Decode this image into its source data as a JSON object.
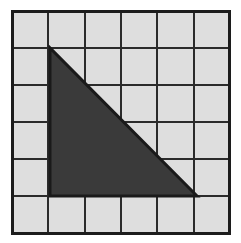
{
  "figure": {
    "title": "Shaded right triangle on a 6 by 6 square grid",
    "canvas": {
      "width": 241,
      "height": 243,
      "background_color": "#ffffff"
    }
  },
  "grid": {
    "columns": 6,
    "rows": 6,
    "origin_x": 12,
    "origin_y": 11,
    "cell_width": 36.3,
    "cell_height": 37.0,
    "cell_fill_color": "#dedede",
    "line_color": "#2b2b2b",
    "line_width": 2,
    "border_color": "#1c1c1c",
    "border_width": 3
  },
  "shape": {
    "name": "right-triangle",
    "kind": "polygon",
    "fill_color": "#3a3a3a",
    "stroke_color": "#1a1a1a",
    "stroke_width": 3,
    "vertices_px": [
      {
        "label": "apex",
        "x": 50,
        "y": 48
      },
      {
        "label": "bottom-left",
        "x": 50,
        "y": 196
      },
      {
        "label": "bottom-right",
        "x": 197,
        "y": 196
      }
    ],
    "vertices_grid": [
      {
        "label": "apex",
        "col": 1,
        "row": 1
      },
      {
        "label": "bottom-left",
        "col": 1,
        "row": 5
      },
      {
        "label": "bottom-right",
        "col": 5,
        "row": 5
      }
    ],
    "legs_in_cells": {
      "base": 4,
      "height": 4
    },
    "area_in_cells": 8
  },
  "chart_data": {
    "type": "scatter",
    "title": "Shaded right triangle on a 6 by 6 square grid",
    "xlabel": "",
    "ylabel": "",
    "xlim": [
      0,
      6
    ],
    "ylim": [
      0,
      6
    ],
    "grid": true,
    "legend": "none",
    "series": [
      {
        "name": "triangle",
        "x": [
          1,
          1,
          5,
          1
        ],
        "y": [
          5,
          1,
          1,
          5
        ]
      }
    ],
    "annotations": [
      "Right angle at grid point (1, 1)",
      "Base spans 4 grid units",
      "Height spans 4 grid units",
      "Shaded area equals 8 grid squares"
    ]
  }
}
